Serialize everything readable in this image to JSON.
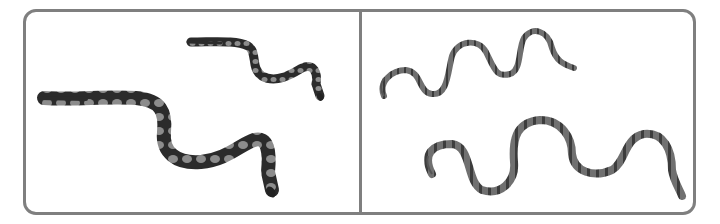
{
  "figure": {
    "layout": "two-panel comparison",
    "panels": [
      {
        "id": "left",
        "subject": "ball python snakes",
        "count": 2,
        "pattern": "dark body with light rounded blotches",
        "colors": {
          "body": "#2a2a2a",
          "blotch": "#8a8a8a"
        }
      },
      {
        "id": "right",
        "subject": "banded slender snakes",
        "count": 2,
        "pattern": "gray body with dark cross-bands",
        "colors": {
          "body": "#6e6e6e",
          "band": "#3a3a3a"
        }
      }
    ],
    "frame_color": "#7f7f7f",
    "background": "#ffffff"
  }
}
